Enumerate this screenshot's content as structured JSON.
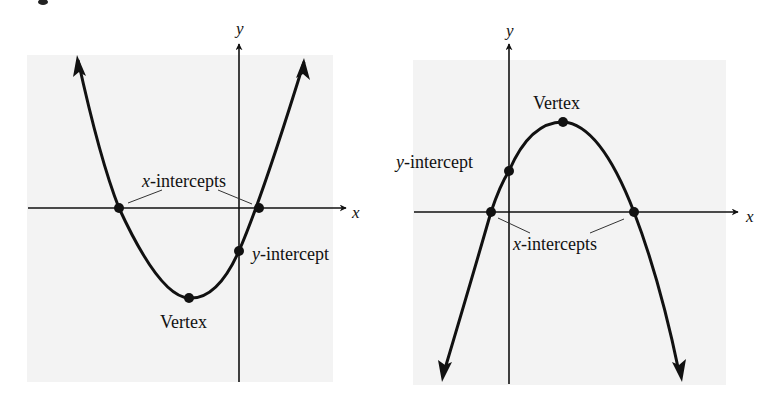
{
  "figure": {
    "colors": {
      "background": "#ffffff",
      "panel": "#f3f3f3",
      "ink": "#111111",
      "leader": "#333333"
    },
    "graphs": [
      {
        "id": "left",
        "description": "Upward-opening parabola",
        "axes": {
          "x_label": "x",
          "y_label": "y"
        },
        "labels": {
          "x_intercepts": {
            "var": "x",
            "text": "-intercepts"
          },
          "y_intercept": {
            "var": "y",
            "text": "-intercept"
          },
          "vertex": "Vertex"
        },
        "points": {
          "x_intercept_1": [
            119,
            208
          ],
          "x_intercept_2": [
            259,
            208
          ],
          "y_intercept": [
            239,
            251
          ],
          "vertex": [
            189,
            298
          ]
        }
      },
      {
        "id": "right",
        "description": "Downward-opening parabola",
        "axes": {
          "x_label": "x",
          "y_label": "y"
        },
        "labels": {
          "x_intercepts": {
            "var": "x",
            "text": "-intercepts"
          },
          "y_intercept": {
            "var": "y",
            "text": "-intercept"
          },
          "vertex": "Vertex"
        },
        "points": {
          "x_intercept_1": [
            491,
            212
          ],
          "x_intercept_2": [
            634,
            212
          ],
          "y_intercept": [
            509,
            171
          ],
          "vertex": [
            563,
            122
          ]
        }
      }
    ]
  }
}
